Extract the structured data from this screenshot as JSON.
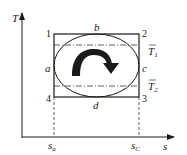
{
  "diagram": {
    "type": "T-s diagram (Carnot cycle comparison)",
    "axes": {
      "y_label": "T",
      "x_label": "s",
      "x_ticks": [
        {
          "base": "s",
          "sub": "a"
        },
        {
          "base": "s",
          "sub": "C"
        }
      ]
    },
    "corners": {
      "top_left": "1",
      "top_right": "2",
      "bottom_right": "3",
      "bottom_left": "4"
    },
    "side_labels": {
      "top": "b",
      "left": "a",
      "right": "c",
      "bottom": "d"
    },
    "mean_temperatures": [
      {
        "base": "T",
        "sub": "1",
        "overbar": true
      },
      {
        "base": "T",
        "sub": "2",
        "overbar": true
      }
    ],
    "cycle_direction": "clockwise",
    "colors": {
      "line": "#1a1a1a",
      "background": "#ffffff"
    }
  }
}
